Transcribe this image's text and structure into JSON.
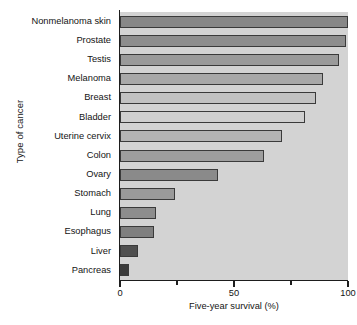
{
  "chart_data": {
    "type": "bar",
    "orientation": "horizontal",
    "title": "",
    "xlabel": "Five-year survival (%)",
    "ylabel": "Type of cancer",
    "xlim": [
      0,
      100
    ],
    "xticks": [
      0,
      50,
      100
    ],
    "xtick_labels": [
      "0",
      "50",
      "100"
    ],
    "xminor_ticks": [
      25,
      75
    ],
    "grid": false,
    "legend": null,
    "categories": [
      "Nonmelanoma skin",
      "Prostate",
      "Testis",
      "Melanoma",
      "Breast",
      "Bladder",
      "Uterine cervix",
      "Colon",
      "Ovary",
      "Stomach",
      "Lung",
      "Esophagus",
      "Liver",
      "Pancreas"
    ],
    "values": [
      100,
      99,
      96,
      89,
      86,
      81,
      71,
      63,
      43,
      24,
      16,
      15,
      8,
      4
    ],
    "bar_colors": [
      "#878787",
      "#8d8d8d",
      "#9a9a9a",
      "#a8a8a8",
      "#c2c2c2",
      "#cfcfcf",
      "#b4b4b4",
      "#9e9e9e",
      "#8a8a8a",
      "#9a9a9a",
      "#8d8d8d",
      "#7f7f7f",
      "#4f4f4f",
      "#3a3a3a"
    ],
    "plot_background": "#d3d3d3",
    "axis_color": "#1d1d1d",
    "bar_edge_color": "#3a3a3a"
  },
  "caption": ""
}
